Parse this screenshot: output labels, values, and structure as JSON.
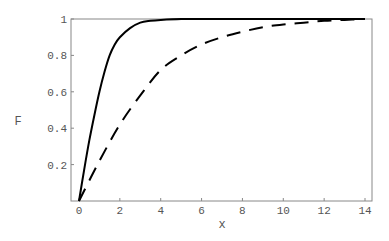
{
  "chart_data": {
    "type": "line",
    "title": "",
    "xlabel": "x",
    "ylabel": "F",
    "xlim": [
      0,
      14
    ],
    "ylim": [
      0,
      1
    ],
    "grid": false,
    "legend": null,
    "x_ticks": [
      "0",
      "2",
      "4",
      "6",
      "8",
      "10",
      "12",
      "14"
    ],
    "y_ticks": [
      "0.2",
      "0.4",
      "0.6",
      "0.8",
      "1"
    ],
    "series": [
      {
        "name": "solid",
        "style": "solid",
        "color": "#000000",
        "x": [
          0,
          0.25,
          0.5,
          0.75,
          1,
          1.25,
          1.5,
          1.75,
          2,
          2.5,
          3,
          3.5,
          4,
          5,
          6,
          8,
          10,
          12,
          14
        ],
        "y": [
          0,
          0.17,
          0.33,
          0.47,
          0.6,
          0.71,
          0.8,
          0.86,
          0.9,
          0.95,
          0.98,
          0.99,
          0.995,
          1,
          1,
          1,
          1,
          1,
          1
        ]
      },
      {
        "name": "dashed",
        "style": "dashed",
        "color": "#000000",
        "x": [
          0,
          1,
          2,
          3,
          4,
          5,
          6,
          7,
          8,
          9,
          10,
          11,
          12,
          13,
          14
        ],
        "y": [
          0,
          0.22,
          0.42,
          0.58,
          0.72,
          0.8,
          0.86,
          0.9,
          0.93,
          0.955,
          0.97,
          0.98,
          0.99,
          0.995,
          1
        ]
      }
    ]
  }
}
